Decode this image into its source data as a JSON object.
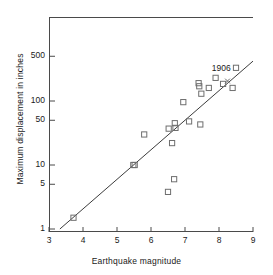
{
  "chart_data": {
    "type": "scatter",
    "title": "",
    "xlabel": "Earthquake magnitude",
    "ylabel": "Maximum displacement in inches",
    "xlim": [
      3,
      9
    ],
    "ylim": [
      1,
      700
    ],
    "yscale": "log",
    "xscale": "linear",
    "grid": false,
    "legend": null,
    "xticks": [
      3,
      4,
      5,
      6,
      7,
      8,
      9
    ],
    "xtick_labels": [
      "3",
      "4",
      "5",
      "6",
      "7",
      "8",
      "9"
    ],
    "yticks": [
      1,
      5,
      10,
      50,
      100,
      500
    ],
    "ytick_labels": [
      "1",
      "5",
      "10",
      "50",
      "100",
      "500"
    ],
    "series": [
      {
        "name": "observations",
        "marker": "open-square",
        "points": [
          {
            "x": 3.72,
            "y": 1.5
          },
          {
            "x": 5.48,
            "y": 10.0
          },
          {
            "x": 5.52,
            "y": 10.0
          },
          {
            "x": 5.8,
            "y": 30.0
          },
          {
            "x": 6.5,
            "y": 3.8
          },
          {
            "x": 6.52,
            "y": 37.0
          },
          {
            "x": 6.62,
            "y": 22.0
          },
          {
            "x": 6.68,
            "y": 6.0
          },
          {
            "x": 6.7,
            "y": 45.0
          },
          {
            "x": 6.72,
            "y": 38.0
          },
          {
            "x": 6.95,
            "y": 96.0
          },
          {
            "x": 7.12,
            "y": 48.0
          },
          {
            "x": 7.4,
            "y": 190.0
          },
          {
            "x": 7.42,
            "y": 170.0
          },
          {
            "x": 7.45,
            "y": 43.0
          },
          {
            "x": 7.48,
            "y": 130.0
          },
          {
            "x": 7.7,
            "y": 160.0
          },
          {
            "x": 7.9,
            "y": 230.0
          },
          {
            "x": 8.12,
            "y": 185.0
          },
          {
            "x": 8.4,
            "y": 160.0
          },
          {
            "x": 8.5,
            "y": 330.0
          }
        ]
      },
      {
        "name": "1906 event",
        "marker": "x",
        "points": [
          {
            "x": 8.25,
            "y": 205.0
          }
        ]
      }
    ],
    "trend_line": {
      "name": "fitted line",
      "x_start": 3.32,
      "y_start": 1.0,
      "x_end": 9.0,
      "y_end": 420.0
    },
    "annotations": [
      {
        "text": "1906",
        "x": 8.08,
        "y": 330.0
      }
    ]
  },
  "figure": {
    "axis_color": "#4a4a4a",
    "marker_color": "#6e6e6e",
    "line_color": "#3c3c3c",
    "text_color": "#1a1a1a",
    "background": "#ffffff"
  }
}
